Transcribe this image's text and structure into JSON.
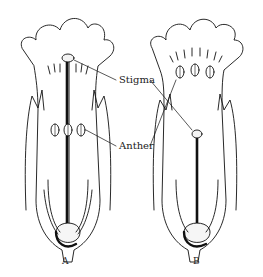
{
  "labels": {
    "stigma": "Stigma",
    "anther": "Anther"
  },
  "captions": {
    "a": "A",
    "b": "B"
  }
}
